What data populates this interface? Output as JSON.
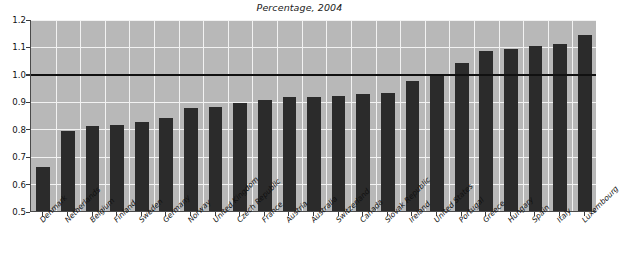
{
  "chart_data": {
    "type": "bar",
    "title": "Percentage, 2004",
    "xlabel": "",
    "ylabel": "",
    "ylim": [
      0.5,
      1.2
    ],
    "ytick_labels": [
      "0.5",
      "0.6",
      "0.7",
      "0.8",
      "0.9",
      "1.0",
      "1.1",
      "1.2"
    ],
    "ytick_values": [
      0.5,
      0.6,
      0.7,
      0.8,
      0.9,
      1.0,
      1.1,
      1.2
    ],
    "grid": true,
    "legend": "none",
    "reference_line": 1.0,
    "bar_color": "#2b2b2b",
    "plot_background": "#b8b8b8",
    "gridline_color": "#f2f2f2",
    "categories": [
      "Denmark",
      "Netherlands",
      "Belgium",
      "Finland",
      "Sweden",
      "Germany",
      "Norway",
      "United Kingdom",
      "Czech Republic",
      "France",
      "Austria",
      "Australia",
      "Switzerland",
      "Canada",
      "Slovak Republic",
      "Ireland",
      "United States",
      "Portugal",
      "Greece",
      "Hungary",
      "Spain",
      "Italy",
      "Luxembourg"
    ],
    "values": [
      0.66,
      0.79,
      0.81,
      0.815,
      0.825,
      0.84,
      0.875,
      0.88,
      0.895,
      0.905,
      0.915,
      0.915,
      0.92,
      0.925,
      0.93,
      0.975,
      1.0,
      1.04,
      1.085,
      1.09,
      1.1,
      1.11,
      1.14
    ]
  }
}
